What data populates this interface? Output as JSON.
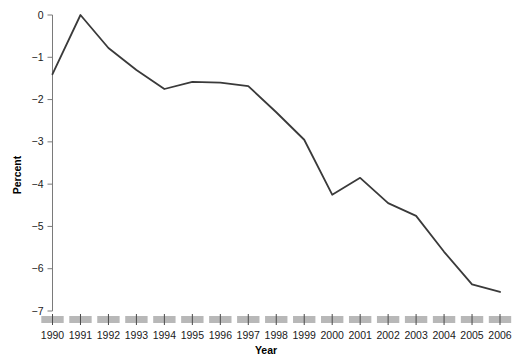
{
  "chart_data": {
    "type": "line",
    "title": "",
    "xlabel": "Year",
    "ylabel": "Percent",
    "x": [
      1990,
      1991,
      1992,
      1993,
      1994,
      1995,
      1996,
      1997,
      1998,
      1999,
      2000,
      2001,
      2002,
      2003,
      2004,
      2005,
      2006
    ],
    "values": [
      -1.4,
      0.0,
      -0.78,
      -1.3,
      -1.75,
      -1.58,
      -1.6,
      -1.68,
      -2.3,
      -2.95,
      -4.25,
      -3.85,
      -4.45,
      -4.75,
      -5.6,
      -6.37,
      -6.55
    ],
    "series": [
      {
        "name": "Percent",
        "values": [
          -1.4,
          0.0,
          -0.78,
          -1.3,
          -1.75,
          -1.58,
          -1.6,
          -1.68,
          -2.3,
          -2.95,
          -4.25,
          -3.85,
          -4.45,
          -4.75,
          -5.6,
          -6.37,
          -6.55
        ]
      }
    ],
    "xtick_labels": [
      "1990",
      "1991",
      "1992",
      "1993",
      "1994",
      "1995",
      "1996",
      "1997",
      "1998",
      "1999",
      "2000",
      "2001",
      "2002",
      "2003",
      "2004",
      "2005",
      "2006"
    ],
    "ytick_labels": [
      "0",
      "−1",
      "−2",
      "−3",
      "−4",
      "−5",
      "−6",
      "−7"
    ],
    "ytick_values": [
      0,
      -1,
      -2,
      -3,
      -4,
      -5,
      -6,
      -7
    ],
    "ylim": [
      -7,
      0
    ],
    "xlim": [
      1990,
      2006
    ],
    "grid": false,
    "legend": false,
    "line_color": "#3a3a3a",
    "axis_color": "#7a7a7a",
    "tick_block_color": "#b8b8b8"
  }
}
